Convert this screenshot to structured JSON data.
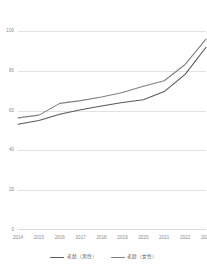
{
  "chart_data": {
    "type": "line",
    "title": "",
    "xlabel": "",
    "ylabel": "",
    "ylim": [
      0,
      110
    ],
    "grid": true,
    "legend_position": "bottom",
    "categories": [
      "2014",
      "2015",
      "2016",
      "2017",
      "2018",
      "2019",
      "2020",
      "2021",
      "2022",
      "2023"
    ],
    "yticks": [
      "0",
      "20",
      "40",
      "60",
      "80",
      "100"
    ],
    "ytick_values": [
      0,
      20,
      40,
      60,
      80,
      100
    ],
    "series": [
      {
        "name": "老龄（男性）",
        "color": "#595959",
        "values": [
          58.5,
          60.5,
          64.0,
          66.5,
          68.5,
          70.5,
          72.0,
          76.5,
          86.0,
          101.0
        ]
      },
      {
        "name": "老龄（女性）",
        "color": "#808080",
        "values": [
          62.0,
          63.5,
          70.0,
          71.5,
          73.5,
          76.0,
          79.5,
          82.5,
          91.5,
          105.5
        ]
      }
    ]
  },
  "axes": {
    "y_tick_labels": [
      "100",
      "80",
      "60",
      "40",
      "20",
      "0"
    ],
    "x_tick_labels": [
      "2014",
      "2015",
      "2016",
      "2017",
      "2018",
      "2019",
      "2020",
      "2021",
      "2022",
      "2023"
    ]
  },
  "legend": {
    "items": [
      {
        "label": "老龄（男性）",
        "color": "#595959"
      },
      {
        "label": "老龄（女性）",
        "color": "#808080"
      }
    ]
  },
  "colors": {
    "gridline": "#e2e2e2",
    "tick_text": "#8a8a8a",
    "legend_text": "#5a5a5a",
    "background": "#ffffff"
  }
}
